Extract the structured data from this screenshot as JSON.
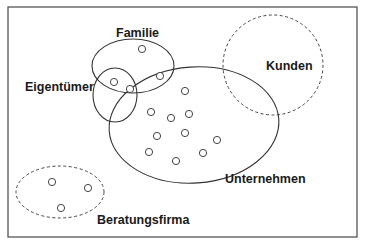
{
  "diagram": {
    "type": "venn",
    "labels": {
      "familie": "Familie",
      "eigentuemer": "Eigentümer",
      "kunden": "Kunden",
      "unternehmen": "Unternehmen",
      "beratungsfirma": "Beratungsfirma"
    },
    "sets": [
      {
        "name": "Familie",
        "border": "solid"
      },
      {
        "name": "Eigentümer",
        "border": "solid"
      },
      {
        "name": "Unternehmen",
        "border": "solid"
      },
      {
        "name": "Kunden",
        "border": "dashed"
      },
      {
        "name": "Beratungsfirma",
        "border": "dashed"
      }
    ],
    "member_counts": {
      "familie_only": 1,
      "familie_and_unternehmen": 1,
      "familie_and_eigentuemer": 1,
      "familie_eigentuemer_unternehmen": 1,
      "unternehmen_only": 10,
      "kunden": 0,
      "beratungsfirma": 3
    },
    "colors": {
      "stroke": "#333333",
      "frame": "#555555",
      "background": "#ffffff"
    }
  }
}
